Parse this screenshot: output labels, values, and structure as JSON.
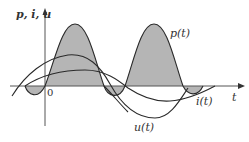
{
  "figure": {
    "y_axis_label": "p, i, u",
    "x_axis_label": "t",
    "origin_label": "0",
    "curves": {
      "power": "p(t)",
      "current": "i(t)",
      "voltage": "u(t)"
    },
    "colors": {
      "line": "#2a2a2a",
      "fill": "#b5b5b5",
      "axis": "#555555"
    }
  }
}
